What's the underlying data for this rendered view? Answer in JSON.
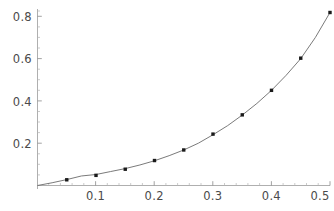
{
  "chart_data": {
    "type": "scatter",
    "title": "",
    "subtitle": "",
    "xlabel": "",
    "ylabel": "",
    "xlim": [
      0,
      0.5
    ],
    "ylim": [
      0,
      0.875
    ],
    "grid": false,
    "legend": null,
    "axis_color": "#9a9a9a",
    "curve_color": "#6b6b6b",
    "point_color": "#1a1a1a",
    "x_ticks": [
      0.1,
      0.2,
      0.3,
      0.4,
      0.5
    ],
    "x_tick_labels": [
      "0.1",
      "0.2",
      "0.3",
      "0.4",
      "0.5"
    ],
    "y_ticks": [
      0.2,
      0.4,
      0.6,
      0.8
    ],
    "y_tick_labels": [
      "0.2",
      "0.4",
      "0.6",
      "0.8"
    ],
    "x_minor_ticks": [
      0.02,
      0.04,
      0.06,
      0.08,
      0.12,
      0.14,
      0.16,
      0.18,
      0.22,
      0.24,
      0.26,
      0.28,
      0.32,
      0.34,
      0.36,
      0.38,
      0.42,
      0.44,
      0.46,
      0.48
    ],
    "y_minor_ticks": [
      0.05,
      0.1,
      0.15,
      0.25,
      0.3,
      0.35,
      0.45,
      0.5,
      0.55,
      0.65,
      0.7,
      0.75,
      0.85
    ],
    "series": [
      {
        "name": "data-points",
        "marker": "square",
        "x": [
          0.05,
          0.1,
          0.15,
          0.2,
          0.25,
          0.3,
          0.35,
          0.4,
          0.45,
          0.5
        ],
        "values": [
          0.027,
          0.048,
          0.077,
          0.118,
          0.168,
          0.243,
          0.334,
          0.45,
          0.602,
          0.818
        ]
      },
      {
        "name": "fitted-curve",
        "marker": "none",
        "x": [
          0.0,
          0.025,
          0.05,
          0.075,
          0.1,
          0.125,
          0.15,
          0.175,
          0.2,
          0.225,
          0.25,
          0.275,
          0.3,
          0.325,
          0.35,
          0.375,
          0.4,
          0.425,
          0.45,
          0.475,
          0.5
        ],
        "values": [
          0.0,
          0.013,
          0.028,
          0.045,
          0.052,
          0.066,
          0.08,
          0.097,
          0.117,
          0.141,
          0.168,
          0.2,
          0.24,
          0.283,
          0.333,
          0.388,
          0.45,
          0.521,
          0.6,
          0.7,
          0.818
        ]
      }
    ]
  },
  "axes": {
    "x_axis_name": "x-axis",
    "y_axis_name": "y-axis"
  }
}
